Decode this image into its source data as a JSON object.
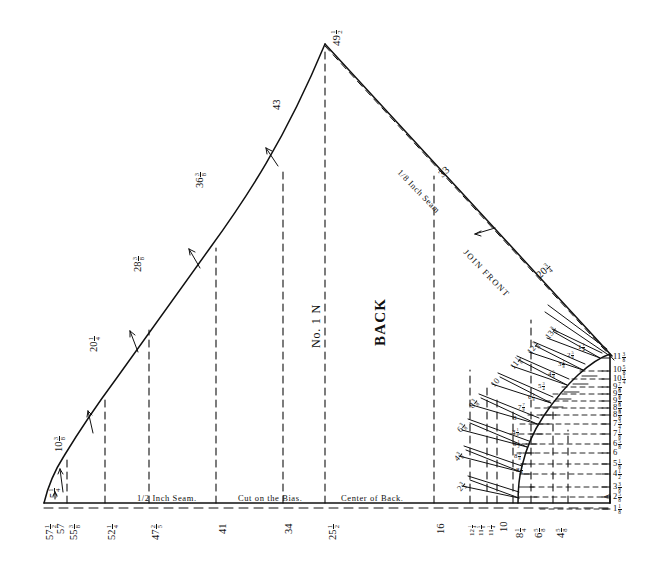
{
  "figure": {
    "title_block": {
      "piece_label": "BACK",
      "piece_number": "No. 1 N"
    },
    "annotations": {
      "seam_bottom": "1/2  Inch  Seam.",
      "bias_note": "Cut on the Bias.",
      "center_back": "Center of Back.",
      "seam_diagonal": "1/8  Inch  Seam",
      "join_front": "JOIN FRONT",
      "corner_marker": "A"
    },
    "apex": {
      "label": "49",
      "frac_num": "1",
      "frac_den": "2"
    },
    "left_curve_labels": [
      {
        "label": "5",
        "frac_num": "1",
        "frac_den": "4",
        "x": 42,
        "y": 487,
        "rot": -90
      },
      {
        "label": "10",
        "frac_num": "3",
        "frac_den": "8",
        "x": 55,
        "y": 440,
        "rot": -90
      },
      {
        "label": "20",
        "frac_num": "1",
        "frac_den": "4",
        "x": 90,
        "y": 340,
        "rot": -90
      },
      {
        "label": "28",
        "frac_num": "3",
        "frac_den": "8",
        "x": 134,
        "y": 258,
        "rot": -90
      },
      {
        "label": "36",
        "frac_num": "3",
        "frac_den": "8",
        "x": 196,
        "y": 172,
        "rot": -90
      },
      {
        "label": "43",
        "frac_num": "",
        "frac_den": "",
        "x": 272,
        "y": 100,
        "rot": -90
      }
    ],
    "right_curve_labels": [
      {
        "label": "33",
        "frac_num": "",
        "frac_den": "",
        "x": 438,
        "y": 178
      },
      {
        "label": "20",
        "frac_num": "3",
        "frac_den": "4",
        "x": 537,
        "y": 277
      }
    ],
    "bottom_axis_labels": [
      {
        "label": "57",
        "frac_num": "1",
        "frac_den": "2",
        "x": 42
      },
      {
        "label": "57",
        "frac_num": "",
        "frac_den": "",
        "x": 54
      },
      {
        "label": "55",
        "frac_num": "3",
        "frac_den": "8",
        "x": 66
      },
      {
        "label": "52",
        "frac_num": "1",
        "frac_den": "4",
        "x": 104
      },
      {
        "label": "47",
        "frac_num": "2",
        "frac_den": "5",
        "x": 148
      },
      {
        "label": "41",
        "frac_num": "",
        "frac_den": "",
        "x": 216
      },
      {
        "label": "34",
        "frac_num": "",
        "frac_den": "",
        "x": 282
      },
      {
        "label": "25",
        "frac_num": "1",
        "frac_den": "2",
        "x": 340
      },
      {
        "label": "16",
        "frac_num": "",
        "frac_den": "",
        "x": 434
      },
      {
        "label": "12",
        "frac_num": "1",
        "frac_den": "4",
        "x": 468
      },
      {
        "label": "11",
        "frac_num": "5",
        "frac_den": "8",
        "x": 477
      },
      {
        "label": "11",
        "frac_num": "1",
        "frac_den": "4",
        "x": 486
      },
      {
        "label": "10",
        "frac_num": "",
        "frac_den": "",
        "x": 497
      },
      {
        "label": "8",
        "frac_num": "1",
        "frac_den": "4",
        "x": 512
      },
      {
        "label": "6",
        "frac_num": "5",
        "frac_den": "8",
        "x": 530
      },
      {
        "label": "4",
        "frac_num": "5",
        "frac_den": "8",
        "x": 551
      }
    ],
    "right_scale_labels": [
      {
        "label": "11",
        "frac_num": "3",
        "frac_den": "8",
        "y": 358
      },
      {
        "label": "10",
        "frac_num": "5",
        "frac_den": "8",
        "y": 371
      },
      {
        "label": "10",
        "frac_num": "1",
        "frac_den": "4",
        "y": 379
      },
      {
        "label": "9",
        "frac_num": "7",
        "frac_den": "8",
        "y": 387
      },
      {
        "label": "9",
        "frac_num": "5",
        "frac_den": "8",
        "y": 394
      },
      {
        "label": "9",
        "frac_num": "1",
        "frac_den": "8",
        "y": 401
      },
      {
        "label": "8",
        "frac_num": "5",
        "frac_den": "8",
        "y": 408
      },
      {
        "label": "8",
        "frac_num": "3",
        "frac_den": "8",
        "y": 415
      },
      {
        "label": "7",
        "frac_num": "3",
        "frac_den": "4",
        "y": 424
      },
      {
        "label": "7",
        "frac_num": "1",
        "frac_den": "8",
        "y": 434
      },
      {
        "label": "6",
        "frac_num": "5",
        "frac_den": "8",
        "y": 444
      },
      {
        "label": "6",
        "frac_num": "",
        "frac_den": "",
        "y": 453
      },
      {
        "label": "5",
        "frac_num": "1",
        "frac_den": "8",
        "y": 464
      },
      {
        "label": "4",
        "frac_num": "1",
        "frac_den": "2",
        "y": 474
      },
      {
        "label": "3",
        "frac_num": "3",
        "frac_den": "8",
        "y": 487
      },
      {
        "label": "2",
        "frac_num": "5",
        "frac_den": "8",
        "y": 497
      },
      {
        "label": "1",
        "frac_num": "1",
        "frac_den": "8",
        "y": 509
      }
    ],
    "grading_diagonal_labels": [
      {
        "label": "2",
        "frac_num": "3",
        "frac_den": "4",
        "x": 455,
        "y": 487,
        "rot": -55
      },
      {
        "label": "4",
        "frac_num": "3",
        "frac_den": "8",
        "x": 455,
        "y": 455,
        "rot": -55
      },
      {
        "label": "6",
        "frac_num": "3",
        "frac_den": "8",
        "x": 458,
        "y": 427,
        "rot": -55
      },
      {
        "label": "8",
        "frac_num": "3",
        "frac_den": "8",
        "x": 470,
        "y": 403,
        "rot": -55
      },
      {
        "label": "10",
        "frac_num": "",
        "frac_den": "",
        "x": 492,
        "y": 381,
        "rot": -55
      },
      {
        "label": "11",
        "frac_num": "1",
        "frac_den": "8",
        "x": 511,
        "y": 363,
        "rot": -55
      },
      {
        "label": "12",
        "frac_num": "3",
        "frac_den": "8",
        "x": 528,
        "y": 348,
        "rot": -55
      },
      {
        "label": "13",
        "frac_num": "3",
        "frac_den": "8",
        "x": 546,
        "y": 333,
        "rot": -55
      }
    ],
    "inner_step_labels": [
      {
        "label": "8",
        "frac_num": "1",
        "frac_den": "8",
        "x": 516,
        "y": 466
      },
      {
        "label": "8",
        "frac_num": "3",
        "frac_den": "8",
        "x": 514,
        "y": 452
      },
      {
        "label": "8",
        "frac_num": "1",
        "frac_den": "2",
        "x": 512,
        "y": 440
      },
      {
        "label": "8",
        "frac_num": "1",
        "frac_den": "8",
        "x": 512,
        "y": 427
      },
      {
        "label": "8",
        "frac_num": "",
        "frac_den": "",
        "x": 512,
        "y": 414
      },
      {
        "label": "7",
        "frac_num": "7",
        "frac_den": "8",
        "x": 516,
        "y": 402
      },
      {
        "label": "6",
        "frac_num": "1",
        "frac_den": "8",
        "x": 527,
        "y": 392
      },
      {
        "label": "5",
        "frac_num": "3",
        "frac_den": "4",
        "x": 537,
        "y": 381
      },
      {
        "label": "4",
        "frac_num": "5",
        "frac_den": "8",
        "x": 547,
        "y": 369
      },
      {
        "label": "3",
        "frac_num": "1",
        "frac_den": "8",
        "x": 557,
        "y": 359
      },
      {
        "label": "2",
        "frac_num": "5",
        "frac_den": "8",
        "x": 566,
        "y": 350
      },
      {
        "label": "1",
        "frac_num": "1",
        "frac_den": "4",
        "x": 577,
        "y": 342
      }
    ],
    "colors": {
      "ink": "#111111",
      "paper": "#ffffff"
    }
  }
}
